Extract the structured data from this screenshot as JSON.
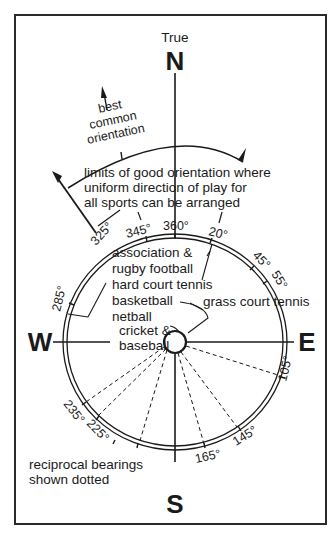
{
  "title": {
    "true_label": "True"
  },
  "cardinals": {
    "north": "N",
    "south": "S",
    "east": "E",
    "west": "W"
  },
  "annotations": {
    "best_line1": "best",
    "best_line2": "common",
    "best_line3": "orientation",
    "limits_line1": "limits of good orientation where",
    "limits_line2": "uniform direction of play for",
    "limits_line3": "all sports can be arranged",
    "reciprocal_line1": "reciprocal bearings",
    "reciprocal_line2": "shown dotted"
  },
  "sports": {
    "assoc_line1": "association &",
    "assoc_line2": "rugby football",
    "hard_court": "hard court tennis",
    "basketball": "basketball",
    "netball": "netball",
    "cricket_line1": "cricket &",
    "cricket_line2": "baseball",
    "grass_court": "grass court tennis"
  },
  "bearings": {
    "b325": "325°",
    "b345": "345°",
    "b360": "360°",
    "b20": "20°",
    "b45": "45°",
    "b55": "55°",
    "b285": "285°",
    "b105": "105°",
    "b145": "145°",
    "b165": "165°",
    "b225": "225°",
    "b235": "235°"
  },
  "colors": {
    "ink": "#1a1a1a",
    "background": "#ffffff"
  }
}
